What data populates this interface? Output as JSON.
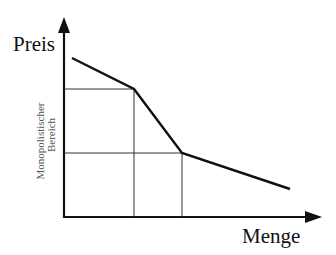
{
  "diagram": {
    "y_axis_label": "Preis",
    "x_axis_label": "Menge",
    "region_label_line1": "Monopolistischer",
    "region_label_line2": "Bereich",
    "colors": {
      "line": "#111111",
      "axis": "#111111",
      "guide": "#333333",
      "region_text": "#555555",
      "background": "#ffffff"
    },
    "curve": {
      "type": "kinked-demand",
      "points": [
        [
          72,
          58
        ],
        [
          134,
          89
        ],
        [
          182,
          153
        ],
        [
          290,
          189
        ]
      ]
    },
    "guides": {
      "kink_upper": {
        "x": 134,
        "y": 89
      },
      "kink_lower": {
        "x": 182,
        "y": 153
      }
    }
  }
}
